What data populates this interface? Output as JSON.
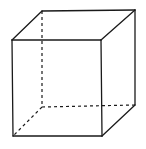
{
  "diagram": {
    "style": "hand-drawn line drawing",
    "colors": {
      "background": "#ffffff",
      "stroke": "#1a1a1a"
    },
    "vertices": {
      "front_top_left": [
        12,
        40
      ],
      "front_top_right": [
        101,
        40
      ],
      "front_bottom_left": [
        13,
        136
      ],
      "front_bottom_right": [
        102,
        136
      ],
      "back_top_left": [
        42,
        11
      ],
      "back_top_right": [
        135,
        10
      ],
      "back_bottom_left": [
        42,
        107
      ],
      "back_bottom_right": [
        135,
        105
      ]
    },
    "visible_edges": [
      [
        "front_top_left",
        "front_top_right"
      ],
      [
        "front_top_right",
        "front_bottom_right"
      ],
      [
        "front_bottom_right",
        "front_bottom_left"
      ],
      [
        "front_bottom_left",
        "front_top_left"
      ],
      [
        "front_top_left",
        "back_top_left"
      ],
      [
        "back_top_left",
        "back_top_right"
      ],
      [
        "back_top_right",
        "front_top_right"
      ],
      [
        "back_top_right",
        "back_bottom_right"
      ],
      [
        "back_bottom_right",
        "front_bottom_right"
      ]
    ],
    "hidden_edges": [
      [
        "back_top_left",
        "back_bottom_left"
      ],
      [
        "back_bottom_left",
        "back_bottom_right"
      ],
      [
        "back_bottom_left",
        "front_bottom_left"
      ]
    ]
  }
}
